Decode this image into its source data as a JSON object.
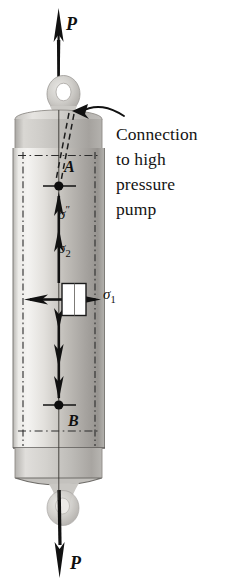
{
  "figure": {
    "type": "engineering-diagram"
  },
  "labels": {
    "load_top": "P",
    "load_bottom": "P",
    "point_a": "A",
    "point_b": "B",
    "sigma_prime_base": "σ",
    "sigma_prime_sup": "″",
    "sigma_2_base": "σ",
    "sigma_2_sub": "2",
    "sigma_1_base": "σ",
    "sigma_1_sub": "1"
  },
  "callout": {
    "line1": "Connection",
    "line2": "to high",
    "line3": "pressure",
    "line4": "pump"
  },
  "colors": {
    "ink": "#101010",
    "line": "#2b2b2b",
    "cylinder_light": "#f2f1ee",
    "cylinder_mid": "#c9c7c2",
    "cylinder_dark": "#8d8b87",
    "cap_gray": "#bcbab6",
    "eyelet_gray": "#c8c6c2",
    "background": "#ffffff"
  },
  "geometry": {
    "canvas_width": 236,
    "canvas_height": 588,
    "cylinder_left": 13,
    "cylinder_right": 105,
    "cylinder_top": 127,
    "cylinder_bottom": 464,
    "axis_x": 59,
    "point_a_y": 186,
    "point_b_y": 405,
    "element_x": 62,
    "element_y": 284,
    "element_w": 24,
    "element_h": 32
  }
}
